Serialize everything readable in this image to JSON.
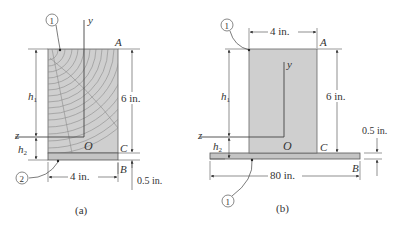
{
  "figure_a": {
    "caption": "(a)",
    "callout_top": "1",
    "callout_bottom": "2",
    "point_A": "A",
    "point_B": "B",
    "point_C": "C",
    "origin": "O",
    "axis_y": "y",
    "axis_z": "z",
    "h1": "h",
    "h1_sub": "1",
    "h2": "h",
    "h2_sub": "2",
    "height_dim": "6 in.",
    "width_dim": "4 in.",
    "plank_dim": "0.5 in."
  },
  "figure_b": {
    "caption": "(b)",
    "callout_top": "1",
    "callout_bottom": "1",
    "point_A": "A",
    "point_B": "B",
    "point_C": "C",
    "origin": "O",
    "axis_y": "y",
    "axis_z": "z",
    "h1": "h",
    "h1_sub": "1",
    "h2": "h",
    "h2_sub": "2",
    "height_dim": "6 in.",
    "width_dim": "4 in.",
    "plank_width_dim": "80 in.",
    "plank_dim": "0.5 in."
  },
  "colors": {
    "fill": "#cfcfcf",
    "plank": "#c4c4c4",
    "stroke": "#555555",
    "grain": "#8c8c8c"
  }
}
